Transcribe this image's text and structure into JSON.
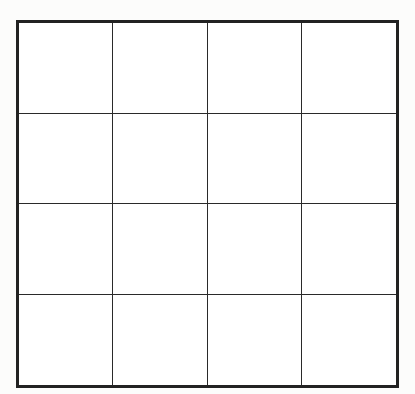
{
  "grid": {
    "rows": 4,
    "columns": 4,
    "border_color": "#222222",
    "line_color": "#2a2a2a",
    "cells": [
      [
        "",
        "",
        "",
        ""
      ],
      [
        "",
        "",
        "",
        ""
      ],
      [
        "",
        "",
        "",
        ""
      ],
      [
        "",
        "",
        "",
        ""
      ]
    ]
  }
}
